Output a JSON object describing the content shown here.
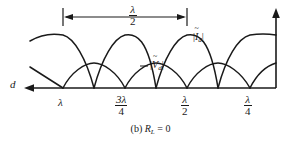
{
  "figure": {
    "caption": "(b) R_L = 0",
    "caption_parts": {
      "prefix": "(b) ",
      "symbol": "R",
      "subscript": "L",
      "relation": " = 0"
    },
    "axis": {
      "horizontal_label": "d",
      "horizontal_direction": "left-arrow",
      "vertical_direction": "up-arrow"
    },
    "dimension": {
      "label_numerator": "λ",
      "label_denominator": "2",
      "description": "lambda over two spacing between successive voltage minima"
    },
    "ticks": [
      {
        "name": "lambda",
        "numerator": "λ",
        "denominator": "",
        "x": 63
      },
      {
        "name": "three-lambda-quarters",
        "numerator": "3λ",
        "denominator": "4",
        "x": 125
      },
      {
        "name": "lambda-half",
        "numerator": "λ",
        "denominator": "2",
        "x": 187
      },
      {
        "name": "lambda-quarter",
        "numerator": "λ",
        "denominator": "4",
        "x": 250
      }
    ],
    "curves": [
      {
        "name": "current-magnitude",
        "label_symbol": "I",
        "label_subscript": "d",
        "label_text": "|Ĩd|"
      },
      {
        "name": "voltage-magnitude",
        "label_symbol": "V",
        "label_subscript": "d",
        "label_text": "|Ṽd|"
      }
    ],
    "colors": {
      "ink": "#1a1a1a",
      "background": "#ffffff"
    }
  },
  "chart_data": {
    "type": "line",
    "xlabel": "d",
    "ylabel": "",
    "xlim": [
      0,
      1.0625
    ],
    "ylim": [
      0,
      1
    ],
    "grid": false,
    "legend": "inline-annotations",
    "x_tick_labels": [
      "λ",
      "3λ/4",
      "λ/2",
      "λ/4"
    ],
    "x_tick_positions": [
      1.0,
      0.75,
      0.5,
      0.25
    ],
    "annotations": [
      "|Ṽd|",
      "|Ĩd|",
      "λ/2"
    ],
    "series": [
      {
        "name": "|Ṽd|",
        "description": "|sin(beta d)| standing wave, zero at multiples of lambda/2 from short, peak amplitude 0.55",
        "amplitude": 0.55,
        "zeros_at": [
          1.0,
          0.75,
          0.5,
          0.25,
          0.0
        ],
        "peaks_at": [
          0.875,
          0.625,
          0.375,
          0.125
        ],
        "peak_value": 0.55
      },
      {
        "name": "|Ĩd|",
        "description": "|cos(beta d)| standing wave, maximum at the short-circuited load, peak amplitude 1.0",
        "amplitude": 1.0,
        "zeros_at": [
          0.875,
          0.625,
          0.375,
          0.125
        ],
        "peaks_at": [
          1.0,
          0.75,
          0.5,
          0.25,
          0.0
        ],
        "peak_value": 1.0
      }
    ]
  }
}
